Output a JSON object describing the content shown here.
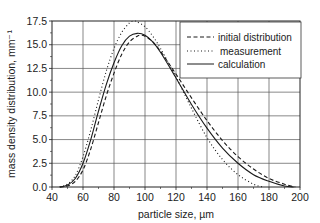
{
  "chart_data": {
    "type": "line",
    "title": "",
    "xlabel": "particle size, µm",
    "ylabel": "mass density distribution, mm⁻¹",
    "xlim": [
      40,
      200
    ],
    "ylim": [
      0,
      17.5
    ],
    "xticks": [
      40,
      60,
      80,
      100,
      120,
      140,
      160,
      180,
      200
    ],
    "xtick_labels": [
      "40",
      "60",
      "80",
      "100",
      "120",
      "140",
      "160",
      "180",
      "200"
    ],
    "yticks": [
      0,
      2.5,
      5,
      7.5,
      10,
      12.5,
      15,
      17.5
    ],
    "ytick_labels": [
      "0.0",
      "2.5",
      "5.0",
      "7.5",
      "10.0",
      "12.5",
      "15.0",
      "17.5"
    ],
    "grid": true,
    "legend_position": "upper right",
    "series": [
      {
        "name": "initial distribution",
        "style": "dashed",
        "x": [
          45,
          50,
          55,
          60,
          65,
          70,
          75,
          80,
          85,
          90,
          95,
          97,
          100,
          105,
          110,
          120,
          130,
          140,
          150,
          160,
          170,
          180,
          190,
          197
        ],
        "y": [
          0,
          0.1,
          0.6,
          1.8,
          4.0,
          6.8,
          9.6,
          12.0,
          14.0,
          15.3,
          15.9,
          16.0,
          15.9,
          15.3,
          14.3,
          11.9,
          9.4,
          7.0,
          4.9,
          3.2,
          1.9,
          0.9,
          0.3,
          0
        ]
      },
      {
        "name": "measurement",
        "style": "dotted",
        "x": [
          45,
          50,
          55,
          60,
          65,
          70,
          75,
          80,
          85,
          90,
          93,
          95,
          100,
          105,
          110,
          120,
          130,
          140,
          150,
          160,
          170,
          176
        ],
        "y": [
          0,
          0.3,
          1.2,
          3.2,
          6.0,
          9.2,
          12.2,
          14.6,
          16.3,
          17.3,
          17.5,
          17.4,
          16.9,
          15.9,
          14.6,
          11.6,
          8.3,
          5.2,
          2.9,
          1.3,
          0.3,
          0
        ]
      },
      {
        "name": "calculation",
        "style": "solid",
        "x": [
          45,
          50,
          55,
          60,
          65,
          70,
          75,
          80,
          85,
          90,
          95,
          100,
          105,
          110,
          120,
          130,
          140,
          150,
          160,
          170,
          180,
          190,
          196
        ],
        "y": [
          0,
          0.2,
          0.9,
          2.5,
          5.0,
          8.0,
          10.8,
          13.1,
          14.9,
          15.9,
          16.2,
          16.0,
          15.3,
          14.2,
          11.5,
          8.7,
          6.2,
          4.1,
          2.5,
          1.3,
          0.6,
          0.1,
          0
        ]
      }
    ]
  },
  "legend": {
    "items": [
      {
        "label": "initial distribution",
        "style": "dashed"
      },
      {
        "label": "measurement",
        "style": "dotted"
      },
      {
        "label": "calculation",
        "style": "solid"
      }
    ]
  },
  "colors": {
    "line": "#1a1a1a",
    "grid": "#555555",
    "background": "#ffffff"
  }
}
